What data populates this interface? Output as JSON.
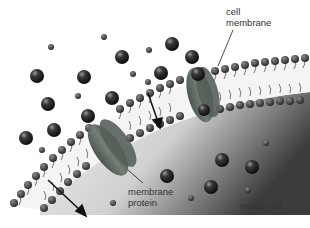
{
  "diagram": {
    "labels": {
      "cell_membrane": [
        "cell",
        "membrane"
      ],
      "membrane_protein": [
        "membrane",
        "protein"
      ],
      "inside_cell": "inside cell"
    },
    "colors": {
      "background": "#ffffff",
      "cell_interior_light": "#e6e6e6",
      "cell_interior_dark": "#4a4a4a",
      "lipid_head": "#2a2a2a",
      "lipid_tail": "#555555",
      "protein": "#5e6a62",
      "molecule": "#1e1e1e",
      "arrow": "#111111"
    }
  }
}
